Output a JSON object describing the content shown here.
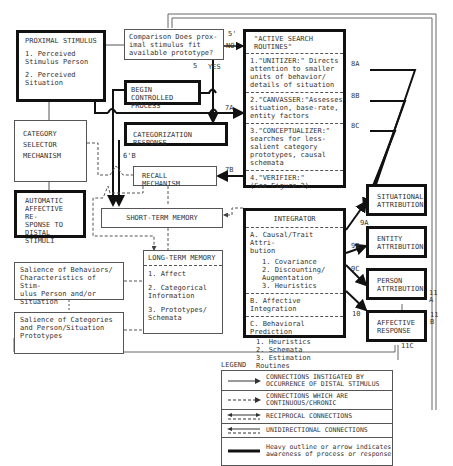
{
  "nodes": {
    "proximal_stimulus": {
      "title": "PROXIMAL STIMULUS",
      "items": [
        "1. Perceived\n   Stimulus Person",
        "2. Perceived\n   Situation"
      ]
    },
    "comparison": {
      "text": "Comparison Does prox-\nimal stimulus fit\navailable prototype?"
    },
    "begin_controlled": {
      "text": "BEGIN\nCONTROLLED PROCESS"
    },
    "categorization_response": {
      "text": "CATEGORIZATION RESPONSE"
    },
    "category_selector": {
      "text": "CATEGORY\nSELECTOR\nMECHANISM"
    },
    "automatic_affective": {
      "text": "AUTOMATIC\nAFFECTIVE RE-\nSPONSE TO\nDISTAL STIMULI"
    },
    "recall_mechanism": {
      "text": "RECALL MECHANISM"
    },
    "short_term_memory": {
      "text": "SHORT-TERM MEMORY"
    },
    "long_term_memory": {
      "title": "LONG-TERM MEMORY",
      "items": [
        "1. Affect",
        "2. Categorical\n   Information",
        "3. Prototypes/\n   Schemata"
      ]
    },
    "salience_behaviors": {
      "text": "Salience of Behaviors/\nCharacteristics of Stim-\nulus Person and/or\nSituation"
    },
    "salience_categories": {
      "text": "Salience of Categories\nand Person/Situation\nPrototypes"
    },
    "active_search": {
      "title": "\"ACTIVE SEARCH\n ROUTINES\"",
      "sections": [
        "1.\"UNITIZER:\" Directs\nattention to smaller\nunits of behavior/\ndetails of situation",
        "2.\"CANVASSER:\"Assesses\nsituation, base-rate,\nentity factors",
        "3.\"CONCEPTUALIZER:\"\nsearches for less-\nsalient category\nprototypes, causal\nschemata",
        "4.\"VERIFIER:\"\n(See Figure 3)"
      ]
    },
    "integrator": {
      "title": "INTEGRATOR",
      "sections": [
        {
          "head": "A. Causal/Trait Attri-\n   bution",
          "items": "1. Covariance\n2. Discounting/\n   Augmentation\n3. Heuristics"
        },
        {
          "head": "B. Affective Integration",
          "items": ""
        },
        {
          "head": "C. Behavioral Prediction",
          "items": "1. Heuristics\n2. Schemata\n3. Estimation Routines"
        }
      ]
    },
    "situational_attribution": {
      "text": "SITUATIONAL\nATTRIBUTION"
    },
    "entity_attribution": {
      "text": "ENTITY\nATTRIBUTION"
    },
    "person_attribution": {
      "text": "PERSON\nATTRIBUTION"
    },
    "affective_response": {
      "text": "AFFECTIVE\nRESPONSE"
    }
  },
  "edge_labels": {
    "l5p": "5'",
    "no": "NO",
    "yes": "YES",
    "l5": "5",
    "l7a": "7A",
    "l7b": "7B",
    "l6b": "6'B",
    "l8a": "8A",
    "l8b": "8B",
    "l8c": "8C",
    "l9a": "9A",
    "l9b": "9B",
    "l9c": "9C",
    "l10": "10",
    "l11a": "11\nA",
    "l11b": "11\nB",
    "l11c": "11C"
  },
  "legend": {
    "title": "LEGEND",
    "rows": [
      "CONNECTIONS INSTIGATED BY\nOCCURRENCE OF DISTAL STIMULUS",
      "CONNECTIONS WHICH ARE\nCONTINUOUS/CHRONIC",
      "RECIPROCAL CONNECTIONS",
      "UNIDIRECTIONAL CONNECTIONS",
      "Heavy outline or arrow indicates\nawareness of process or response"
    ]
  }
}
